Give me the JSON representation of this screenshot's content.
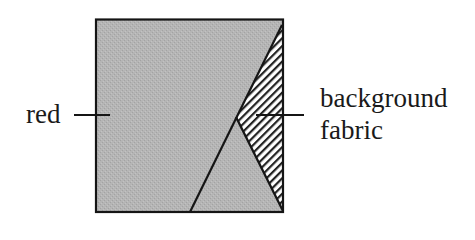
{
  "diagram": {
    "labels": {
      "left": "red",
      "right_line1": "background",
      "right_line2": "fabric"
    },
    "colors": {
      "red_fill": "#b3b3b3",
      "outline": "#151515",
      "hatch_line": "#222222",
      "hatch_bg": "#ffffff",
      "background": "#ffffff"
    },
    "geometry": {
      "square": {
        "x1": 96,
        "y1": 19,
        "x2": 283,
        "y2": 212
      },
      "hatched_triangle": {
        "top": [
          282,
          27
        ],
        "vertex": [
          236,
          117
        ],
        "bottom": [
          283,
          211
        ]
      },
      "diagonal_bottom": [
        190,
        212
      ]
    }
  }
}
